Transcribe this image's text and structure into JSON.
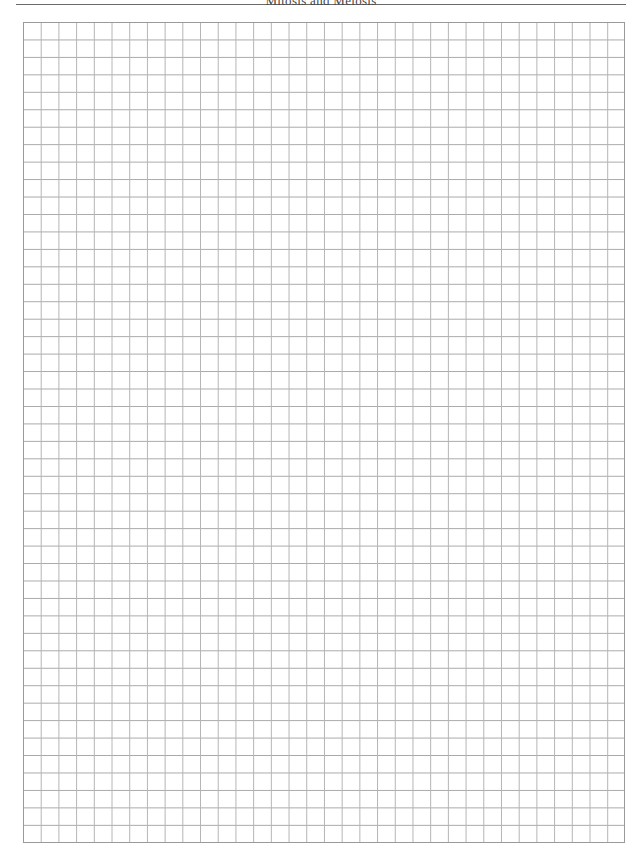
{
  "header": {
    "title": "Mitosis and Meiosis"
  },
  "grid": {
    "columns": 34,
    "rows": 47,
    "line_color": "#a8a8a8",
    "border_color": "#9a9a9a",
    "background": "#ffffff"
  }
}
